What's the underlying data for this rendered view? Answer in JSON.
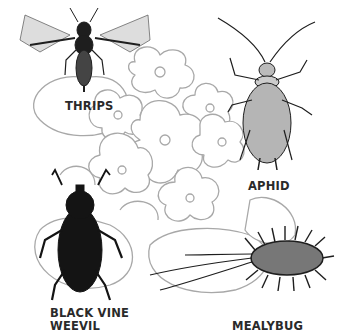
{
  "figure": {
    "background_color": "#ffffff",
    "plant_line_color": "#a8a8a8",
    "insect_color": "#1e1e1e",
    "labels": {
      "thrips": "THRIPS",
      "aphid": "APHID",
      "weevil_line1": "BLACK VINE",
      "weevil_line2": "WEEVIL",
      "mealybug": "MEALYBUG"
    }
  }
}
